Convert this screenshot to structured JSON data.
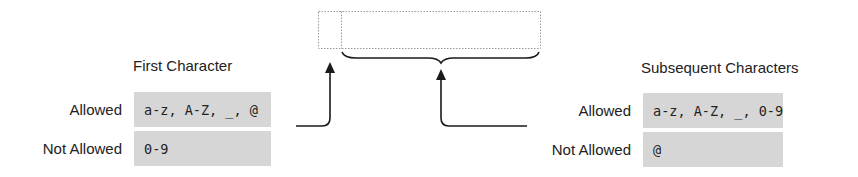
{
  "diagram": {
    "identifier_box": {
      "segments": [
        "first-character-slot",
        "subsequent-characters-slot"
      ]
    },
    "first_character": {
      "heading": "First Character",
      "rows": [
        {
          "label": "Allowed",
          "value": "a-z, A-Z, _, @"
        },
        {
          "label": "Not Allowed",
          "value": "0-9"
        }
      ]
    },
    "subsequent_characters": {
      "heading": "Subsequent Characters",
      "rows": [
        {
          "label": "Allowed",
          "value": "a-z, A-Z, _, 0-9"
        },
        {
          "label": "Not Allowed",
          "value": "@"
        }
      ]
    },
    "colors": {
      "cell_background": "#d6d6d6",
      "box_border": "#9a9a9a",
      "arrow": "#1a1a1a"
    }
  }
}
